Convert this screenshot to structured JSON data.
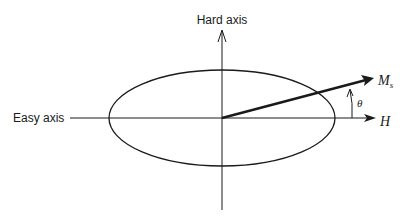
{
  "diagram": {
    "labels": {
      "hard_axis": "Hard axis",
      "easy_axis": "Easy axis",
      "field": "H",
      "magnetization_main": "M",
      "magnetization_sub": "s",
      "angle": "θ"
    },
    "geometry": {
      "center": [
        222,
        118
      ],
      "ellipse_rx": 113,
      "ellipse_ry": 48,
      "ms_vector_tip": [
        372,
        78
      ],
      "angle_arc_x": 352
    },
    "colors": {
      "stroke": "#1a1a1a",
      "background": "#ffffff"
    }
  }
}
